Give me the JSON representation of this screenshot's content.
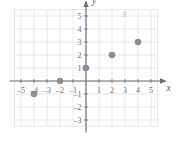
{
  "figure": {
    "background_color": "#ffffff"
  },
  "chart_data": {
    "type": "scatter",
    "title": "",
    "xlabel": "x",
    "ylabel": "y",
    "series": [
      {
        "name": "g",
        "points": [
          {
            "x": -4,
            "y": -1
          },
          {
            "x": -2,
            "y": 0
          },
          {
            "x": 0,
            "y": 1
          },
          {
            "x": 2,
            "y": 2
          },
          {
            "x": 4,
            "y": 3
          }
        ],
        "marker": "filled-circle",
        "color": "#8d8d93"
      }
    ],
    "xlim": [
      -5.5,
      5.5
    ],
    "ylim": [
      -3.5,
      5.5
    ],
    "xticks": [
      -5,
      -4,
      -3,
      -2,
      -1,
      1,
      2,
      3,
      4,
      5
    ],
    "yticks": [
      -3,
      -2,
      -1,
      1,
      2,
      3,
      4,
      5
    ],
    "xtick_labels": [
      "–5",
      "–4",
      "–3",
      "–2",
      "–1",
      "1",
      "2",
      "3",
      "4",
      "5"
    ],
    "ytick_labels": [
      "–3",
      "–2",
      "–1",
      "1",
      "2",
      "3",
      "4",
      "5"
    ],
    "grid": true,
    "grid_color": "#e3e3e8",
    "axis_color": "#6e6e72",
    "legend": false,
    "annotations": [
      {
        "text": "g",
        "x": 3.0,
        "y": 5.1,
        "color": "#c9c9cd"
      }
    ]
  },
  "axis_labels": {
    "x_axis_name": "x",
    "y_axis_name": "y"
  },
  "function_label": {
    "text": "g"
  },
  "x_ticks": [
    {
      "value": -5,
      "label": "–5"
    },
    {
      "value": -4,
      "label": "–4"
    },
    {
      "value": -3,
      "label": "–3"
    },
    {
      "value": -2,
      "label": "–2"
    },
    {
      "value": -1,
      "label": "–1"
    },
    {
      "value": 1,
      "label": "1"
    },
    {
      "value": 2,
      "label": "2"
    },
    {
      "value": 3,
      "label": "3"
    },
    {
      "value": 4,
      "label": "4"
    },
    {
      "value": 5,
      "label": "5"
    }
  ],
  "y_ticks": [
    {
      "value": 5,
      "label": "5"
    },
    {
      "value": 4,
      "label": "4"
    },
    {
      "value": 3,
      "label": "3"
    },
    {
      "value": 2,
      "label": "2"
    },
    {
      "value": 1,
      "label": "1"
    },
    {
      "value": -1,
      "label": "–1"
    },
    {
      "value": -2,
      "label": "–2"
    },
    {
      "value": -3,
      "label": "–3"
    }
  ],
  "points": [
    {
      "label": "(–4, –1)",
      "x": -4,
      "y": -1
    },
    {
      "label": "(–2, 0)",
      "x": -2,
      "y": 0
    },
    {
      "label": "(0, 1)",
      "x": 0,
      "y": 1
    },
    {
      "label": "(2, 2)",
      "x": 2,
      "y": 2
    },
    {
      "label": "(4, 3)",
      "x": 4,
      "y": 3
    }
  ],
  "colors": {
    "point": "#8d8d93",
    "axis": "#6e6e72",
    "grid": "#e3e3e8",
    "tick_text": "#6e6e72",
    "function_label": "#c9c9cd",
    "background": "#ffffff"
  },
  "geometry": {
    "origin_x": 86,
    "origin_y": 81,
    "unit_px": 13,
    "point_radius": 3.3
  }
}
